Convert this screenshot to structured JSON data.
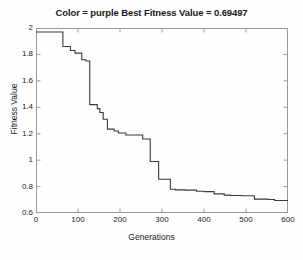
{
  "chart_data": {
    "type": "line",
    "title": "Color = purple Best Fitness Value = 0.69497",
    "xlabel": "Generations",
    "ylabel": "Fitness Value",
    "xlim": [
      0,
      600
    ],
    "ylim": [
      0.6,
      2.0
    ],
    "xticks": [
      0,
      100,
      200,
      300,
      400,
      500,
      600
    ],
    "xtick_labels": [
      "0",
      "100",
      "200",
      "300",
      "400",
      "500",
      "600"
    ],
    "yticks": [
      0.6,
      0.8,
      1.0,
      1.2,
      1.4,
      1.6,
      1.8,
      2.0
    ],
    "ytick_labels": [
      "0.6",
      "0.8",
      "1",
      "1.2",
      "1.4",
      "1.6",
      "1.8",
      "2"
    ],
    "grid": false,
    "legend": false,
    "line_color": "#3a3a3a",
    "line_width": 1.1,
    "step_style": "post",
    "best_fitness_value": 0.69497,
    "color_label": "purple",
    "series": [
      {
        "name": "Best Fitness Value",
        "x": [
          0,
          64,
          64,
          82,
          82,
          93,
          93,
          109,
          109,
          119,
          119,
          128,
          128,
          146,
          146,
          152,
          152,
          160,
          160,
          170,
          170,
          186,
          186,
          196,
          196,
          214,
          214,
          254,
          254,
          272,
          272,
          292,
          292,
          320,
          320,
          332,
          332,
          356,
          356,
          382,
          382,
          400,
          400,
          424,
          424,
          448,
          448,
          462,
          462,
          490,
          490,
          520,
          520,
          552,
          552,
          568,
          568,
          600
        ],
        "y": [
          1.97,
          1.97,
          1.86,
          1.86,
          1.83,
          1.83,
          1.81,
          1.81,
          1.76,
          1.76,
          1.75,
          1.75,
          1.42,
          1.42,
          1.39,
          1.39,
          1.36,
          1.36,
          1.31,
          1.31,
          1.235,
          1.235,
          1.22,
          1.22,
          1.205,
          1.205,
          1.19,
          1.19,
          1.16,
          1.16,
          0.99,
          0.99,
          0.855,
          0.855,
          0.78,
          0.78,
          0.775,
          0.775,
          0.773,
          0.773,
          0.765,
          0.765,
          0.762,
          0.762,
          0.745,
          0.745,
          0.735,
          0.735,
          0.733,
          0.733,
          0.73,
          0.73,
          0.705,
          0.705,
          0.702,
          0.702,
          0.695,
          0.695
        ]
      }
    ],
    "axes_color": "#9a9a9a",
    "background_color": "#fefefe"
  }
}
